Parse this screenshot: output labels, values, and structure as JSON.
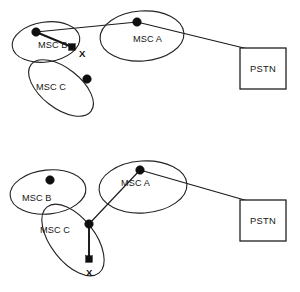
{
  "figure": {
    "background_color": "#ffffff",
    "stroke_color": "#23201e",
    "node_color": "#100f0e",
    "width": 300,
    "height": 292
  },
  "diagrams": [
    {
      "id": "top-diagram",
      "name": "handover-before",
      "cells": [
        {
          "id": "msc-b",
          "label": "MSC B",
          "label_x": 38,
          "label_y": 48,
          "cx": 46,
          "cy": 42,
          "rx": 34,
          "ry": 20,
          "rotate": -8
        },
        {
          "id": "msc-a",
          "label": "MSC A",
          "label_x": 133,
          "label_y": 42,
          "cx": 142,
          "cy": 36,
          "rx": 42,
          "ry": 25,
          "rotate": -4
        },
        {
          "id": "msc-c",
          "label": "MSC C",
          "label_x": 36,
          "label_y": 90,
          "cx": 61,
          "cy": 88,
          "rx": 38,
          "ry": 20,
          "rotate": 38
        }
      ],
      "nodes": [
        {
          "id": "bs-b",
          "type": "dot",
          "x": 36,
          "y": 32,
          "r": 4.3
        },
        {
          "id": "bs-a",
          "type": "dot",
          "x": 137,
          "y": 22,
          "r": 4.3
        },
        {
          "id": "bs-c",
          "type": "dot",
          "x": 87,
          "y": 79,
          "r": 4.3
        },
        {
          "id": "mobile-x",
          "type": "square",
          "x": 72,
          "y": 47,
          "size": 6.6
        }
      ],
      "links": [
        {
          "id": "link-b-to-a",
          "from": "bs-b",
          "to": "bs-a",
          "x1": 36,
          "y1": 32,
          "x2": 137,
          "y2": 22,
          "weight": "thin"
        },
        {
          "id": "link-b-to-x",
          "from": "bs-b",
          "to": "mobile-x",
          "x1": 36,
          "y1": 32,
          "x2": 72,
          "y2": 47,
          "weight": "thick"
        },
        {
          "id": "link-a-to-pstn",
          "from": "bs-a",
          "to": "pstn",
          "x1": 137,
          "y1": 22,
          "x2": 248,
          "y2": 49,
          "weight": "thin"
        }
      ],
      "markers": [
        {
          "id": "marker-x",
          "label": "X",
          "x": 79,
          "y": 57
        }
      ],
      "box": {
        "id": "pstn",
        "label": "PSTN",
        "x": 240,
        "y": 48,
        "w": 46,
        "h": 41,
        "label_x": 263,
        "label_y": 72
      }
    },
    {
      "id": "bottom-diagram",
      "name": "handover-after",
      "cells": [
        {
          "id": "msc-b",
          "label": "MSC B",
          "label_x": 22,
          "label_y": 201,
          "cx": 48,
          "cy": 192,
          "rx": 38,
          "ry": 22,
          "rotate": -6
        },
        {
          "id": "msc-a",
          "label": "MSC A",
          "label_x": 121,
          "label_y": 186,
          "cx": 143,
          "cy": 187,
          "rx": 44,
          "ry": 26,
          "rotate": -4
        },
        {
          "id": "msc-c",
          "label": "MSC C",
          "label_x": 40,
          "label_y": 233,
          "cx": 73,
          "cy": 240,
          "rx": 42,
          "ry": 22,
          "rotate": 52
        }
      ],
      "nodes": [
        {
          "id": "bs-b",
          "type": "dot",
          "x": 50,
          "y": 180,
          "r": 4.3
        },
        {
          "id": "bs-a",
          "type": "dot",
          "x": 140,
          "y": 170,
          "r": 4.3
        },
        {
          "id": "bs-c",
          "type": "dot",
          "x": 89,
          "y": 224,
          "r": 4.3
        },
        {
          "id": "mobile-x",
          "type": "square",
          "x": 89,
          "y": 259,
          "size": 6.6
        }
      ],
      "links": [
        {
          "id": "link-c-to-a",
          "from": "bs-c",
          "to": "bs-a",
          "x1": 89,
          "y1": 224,
          "x2": 140,
          "y2": 170,
          "weight": "thin"
        },
        {
          "id": "link-c-to-x",
          "from": "bs-c",
          "to": "mobile-x",
          "x1": 89,
          "y1": 224,
          "x2": 89,
          "y2": 259,
          "weight": "thick"
        },
        {
          "id": "link-a-to-pstn",
          "from": "bs-a",
          "to": "pstn",
          "x1": 140,
          "y1": 170,
          "x2": 248,
          "y2": 201,
          "weight": "thin"
        }
      ],
      "markers": [
        {
          "id": "marker-x",
          "label": "X",
          "x": 86,
          "y": 276
        }
      ],
      "box": {
        "id": "pstn",
        "label": "PSTN",
        "x": 240,
        "y": 200,
        "w": 46,
        "h": 41,
        "label_x": 263,
        "label_y": 224
      }
    }
  ]
}
